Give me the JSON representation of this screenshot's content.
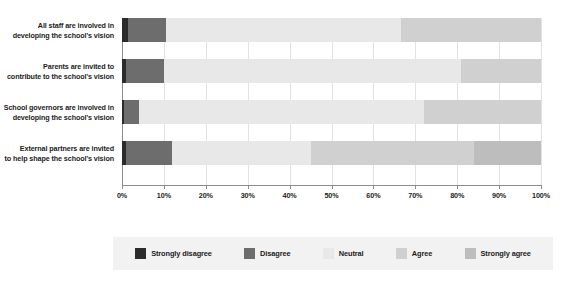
{
  "chart_data": {
    "type": "bar",
    "orientation": "horizontal",
    "stacked": true,
    "stack_mode": "percent",
    "title": "",
    "subtitle": "",
    "xlabel": "",
    "ylabel": "",
    "xlim": [
      0,
      100
    ],
    "xticks": [
      0,
      10,
      20,
      30,
      40,
      50,
      60,
      70,
      80,
      90,
      100
    ],
    "xticklabels": [
      "0%",
      "10%",
      "20%",
      "30%",
      "40%",
      "50%",
      "60%",
      "70%",
      "80%",
      "90%",
      "100%"
    ],
    "grid": true,
    "grid_axis": "x",
    "legend_position": "bottom",
    "categories": [
      "All staff are involved in developing the school's vision",
      "Parents are invited to contribute to the school's vision",
      "School governors are involved in developing the school's vision",
      "External partners are invited to help shape the school's vision"
    ],
    "category_lines": [
      [
        "All staff are involved in",
        "developing the school's vision"
      ],
      [
        "Parents are invited to",
        "contribute to the school's vision"
      ],
      [
        "School governors are involved in",
        "developing the school's vision"
      ],
      [
        "External partners are invited",
        "to help shape the school's vision"
      ]
    ],
    "series": [
      {
        "name": "Strongly disagree",
        "color": "#2b2b2b",
        "values": [
          1.5,
          1.0,
          0.5,
          1.0
        ]
      },
      {
        "name": "Disagree",
        "color": "#6d6d6d",
        "values": [
          9.0,
          9.0,
          3.5,
          11.0
        ]
      },
      {
        "name": "Neutral",
        "color": "#e8e8e8",
        "values": [
          56.0,
          71.0,
          68.0,
          33.0
        ]
      },
      {
        "name": "Agree",
        "color": "#d0d0d0",
        "values": [
          33.5,
          19.0,
          28.0,
          39.0
        ]
      },
      {
        "name": "Strongly agree",
        "color": "#bdbdbd",
        "values": [
          0.0,
          0.0,
          0.0,
          16.0
        ]
      }
    ]
  },
  "legend": {
    "items": [
      {
        "label": "Strongly disagree"
      },
      {
        "label": "Disagree"
      },
      {
        "label": "Neutral"
      },
      {
        "label": "Agree"
      },
      {
        "label": "Strongly agree"
      }
    ]
  },
  "colors": {
    "strongly_disagree": "#2b2b2b",
    "disagree": "#6d6d6d",
    "neutral": "#e8e8e8",
    "agree": "#d0d0d0",
    "strongly_agree": "#bdbdbd",
    "gridline": "#e2e2e2",
    "axis": "#8d8d8d",
    "legend_background": "#f2f2f2",
    "text": "#1c1c1c",
    "page_background": "#ffffff"
  }
}
